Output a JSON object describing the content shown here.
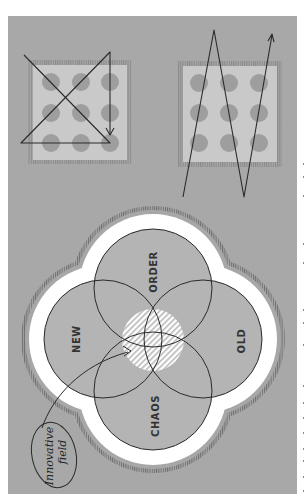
{
  "figure": {
    "background_color": "#a7a7a7",
    "panel_light_color": "#c9c9c9",
    "dot_color": "#9c9c9c",
    "ring_white": "#ffffff",
    "stroke_color": "#2a2a2a",
    "orientation": "rotated 90 degrees counter-clockwise"
  },
  "top_left_panel": {
    "description": "3x3 dot grid with triangle-and-cross path drawn over it ending in an arrow",
    "dots": 9,
    "path": "triangle with crossing diagonals and downward arrow"
  },
  "top_right_panel": {
    "description": "3x3 dot grid with zigzag path extending beyond the grid ending in an arrow",
    "dots": 9,
    "path": "zigzag extending outside the square"
  },
  "venn": {
    "circles": [
      {
        "label": "ORDER",
        "position": "top"
      },
      {
        "label": "NEW",
        "position": "left"
      },
      {
        "label": "OLD",
        "position": "right"
      },
      {
        "label": "CHAOS",
        "position": "bottom"
      }
    ],
    "center_region": "hatched overlap"
  },
  "annotation": {
    "line1": "Innovative",
    "line2": "field"
  }
}
